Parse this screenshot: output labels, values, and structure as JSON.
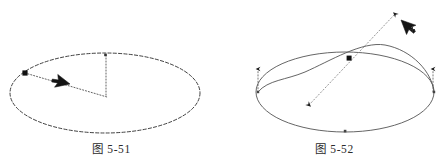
{
  "document": {
    "background_color": "#ffffff",
    "ink_color": "#2b2b2b",
    "marker_color": "#111111",
    "width": 446,
    "height": 168
  },
  "figures": [
    {
      "id": "fig-5-51",
      "caption": "图 5-51",
      "description": "ellipse with dotted radius lines and mouse cursor",
      "ellipse": {
        "cx": 105,
        "cy": 93,
        "rx": 95,
        "ry": 40,
        "stroke": "#2b2b2b",
        "dash": "3 2"
      },
      "markers": [
        {
          "name": "square-handle",
          "shape": "square",
          "x": 25,
          "y": 73,
          "size": 5
        },
        {
          "name": "top-point",
          "shape": "dot",
          "x": 105,
          "y": 55,
          "size": 2
        }
      ],
      "dotted_lines": [
        {
          "name": "radius-line",
          "x1": 25,
          "y1": 73,
          "x2": 107,
          "y2": 97
        },
        {
          "name": "vertical-line",
          "x1": 106,
          "y1": 55,
          "x2": 106,
          "y2": 97
        }
      ],
      "cursor": {
        "x": 70,
        "y": 84,
        "direction": "down-right",
        "plus_badge": false
      }
    },
    {
      "id": "fig-5-52",
      "caption": "图 5-52",
      "description": "ellipse with tilted companion curve, double headed dotted axis and cursor",
      "ellipse": {
        "cx": 345,
        "cy": 92,
        "rx": 89,
        "ry": 40,
        "stroke": "#5a5a5a",
        "dash": "none"
      },
      "tilted_curve": {
        "name": "rotated-ellipse-arc",
        "start": [
          258,
          92
        ],
        "end": [
          434,
          92
        ],
        "apex": [
          382,
          45
        ],
        "dip": [
          300,
          84
        ]
      },
      "markers": [
        {
          "name": "square-handle",
          "shape": "square",
          "x": 349,
          "y": 58,
          "size": 5
        },
        {
          "name": "left-vertex",
          "shape": "dot",
          "x": 258,
          "y": 92,
          "size": 2
        },
        {
          "name": "right-vertex",
          "shape": "dot",
          "x": 434,
          "y": 92,
          "size": 2
        },
        {
          "name": "bottom-point",
          "shape": "dot",
          "x": 345,
          "y": 131,
          "size": 2
        }
      ],
      "dotted_lines": [
        {
          "name": "main-axis-arrow",
          "x1": 308,
          "y1": 106,
          "x2": 396,
          "y2": 13,
          "arrows": "both"
        },
        {
          "name": "left-normal-arrow",
          "x1": 258,
          "y1": 92,
          "x2": 258,
          "y2": 67,
          "arrows": "end"
        },
        {
          "name": "right-normal-arrow",
          "x1": 433,
          "y1": 92,
          "x2": 433,
          "y2": 67,
          "arrows": "end"
        }
      ],
      "cursor": {
        "x": 397,
        "y": 18,
        "direction": "up-left",
        "plus_badge": true,
        "plus_label": "+"
      }
    }
  ]
}
